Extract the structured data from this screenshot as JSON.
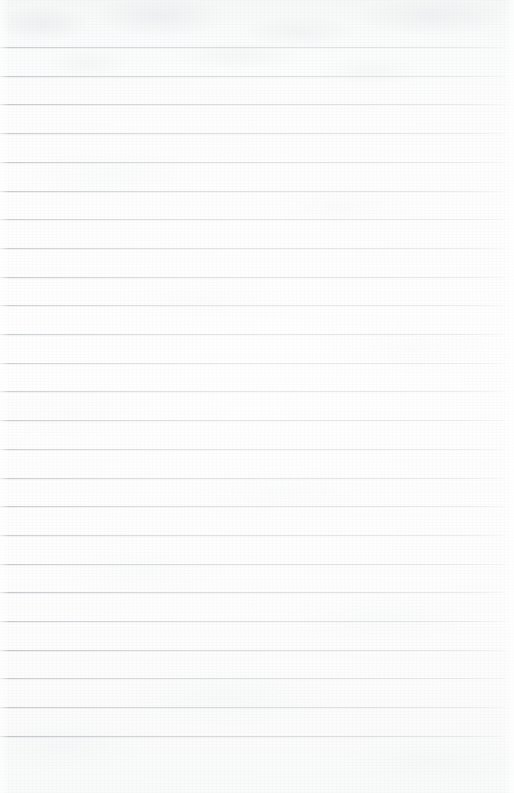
{
  "document": {
    "type": "scanned-ruled-paper",
    "title": "Blank lined notebook page",
    "page_width": 514,
    "page_height": 793,
    "background_color": "#fdfdfd",
    "has_text": false,
    "has_handwriting": false,
    "has_margin_rule": false,
    "text_content": ""
  },
  "ruling": {
    "line_color": "#c1c6ca",
    "line_color_left": "#b0b6bb",
    "line_color_right": "#d8dcdf",
    "line_count": 25,
    "line_thickness_px": 1,
    "line_spacing_px": 28.7,
    "first_line_y": 47,
    "last_line_y": 736,
    "line_start_x": 0,
    "line_end_x": 505,
    "top_margin_px": 47,
    "bottom_margin_px": 57,
    "right_margin_px": 9,
    "line_positions_y": [
      47,
      75.7,
      104.4,
      133.1,
      161.8,
      190.5,
      219.2,
      247.9,
      276.6,
      305.3,
      334,
      362.7,
      391.4,
      420.1,
      448.8,
      477.5,
      506.2,
      534.9,
      563.6,
      592.3,
      621,
      649.7,
      678.4,
      707.1,
      735.8
    ]
  },
  "texture": {
    "grain_tone": "#cdd2d6",
    "top_shading_tone": "#f5f6f6",
    "description": "faint mottled scanner grain, slightly darker band across the top margin"
  }
}
